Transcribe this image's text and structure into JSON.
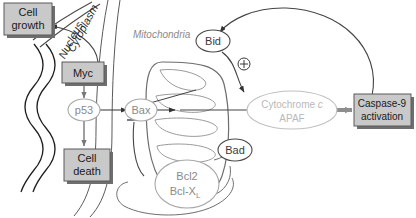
{
  "diagram": {
    "compartment_labels": [
      {
        "name": "cytoplasm-label",
        "text": "Cytoplasm"
      },
      {
        "name": "nucleus-label",
        "text": "Nucleus"
      },
      {
        "name": "mitochondria-label",
        "text": "Mitochondria"
      }
    ],
    "boxes": [
      {
        "id": "cell-growth",
        "label_line1": "Cell",
        "label_line2": "growth"
      },
      {
        "id": "myc",
        "label_line1": "Myc",
        "label_line2": ""
      },
      {
        "id": "cell-death",
        "label_line1": "Cell",
        "label_line2": "death"
      },
      {
        "id": "caspase9",
        "label_line1": "Caspase-9",
        "label_line2": "activation"
      }
    ],
    "ovals": [
      {
        "id": "p53",
        "label": "p53",
        "style": "gray-text"
      },
      {
        "id": "bax",
        "label": "Bax",
        "style": "gray-text"
      },
      {
        "id": "bid",
        "label": "Bid",
        "style": "dark-text"
      },
      {
        "id": "bad",
        "label": "Bad",
        "style": "dark-text"
      },
      {
        "id": "bcl2",
        "label_line1": "Bcl2",
        "label_line2_a": "Bcl-X",
        "label_line2_sub": "L",
        "style": "gray-text"
      },
      {
        "id": "cytochrome-apaf",
        "label_line1_a": "Cytochrome ",
        "label_line1_italic": "c",
        "label_line2": "APAF",
        "style": "light-gray-text"
      }
    ],
    "symbols": [
      {
        "id": "plus-circle",
        "glyph": "⊕",
        "meaning": "activation"
      }
    ],
    "colors": {
      "box_fill": "#c9c9c9",
      "box_border": "#5a5a5a",
      "box_shadow": "#6e6e6e",
      "stroke_dark": "#2b2b2b",
      "stroke_gray": "#8d8d8d",
      "stroke_light": "#b4b4b4",
      "text_dark": "#1a1a1a",
      "text_gray": "#8a8a8a",
      "text_light_gray": "#b9b9b9",
      "background": "#ffffff"
    }
  }
}
